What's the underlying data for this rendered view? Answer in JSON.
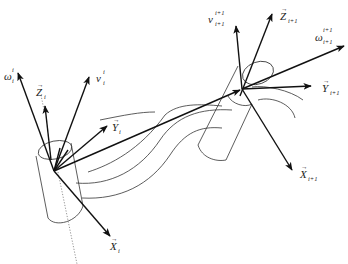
{
  "figure": {
    "type": "kinematic frame diagram",
    "frames": [
      {
        "id": "i",
        "origin": [
          54,
          171
        ],
        "vectors": [
          {
            "name": "omega",
            "label": "ω",
            "sup": "i",
            "sub": "i",
            "tip": [
              18,
              73
            ],
            "label_pos": [
              4,
              72
            ]
          },
          {
            "name": "z-axis",
            "label": "Z",
            "sub": "i",
            "vector_arrow": true,
            "tip": [
              45,
              106
            ],
            "label_pos": [
              36,
              86
            ]
          },
          {
            "name": "v",
            "label": "v",
            "sup": "i",
            "sub": "i",
            "tip": [
              89,
              77
            ],
            "label_pos": [
              95,
              74
            ]
          },
          {
            "name": "y-axis",
            "label": "Y",
            "sub": "i",
            "vector_arrow": true,
            "tip": [
              107,
              126
            ],
            "label_pos": [
              112,
              130
            ]
          },
          {
            "name": "x-axis",
            "label": "X",
            "sub": "i",
            "vector_arrow": true,
            "tip": [
              110,
              236
            ],
            "label_pos": [
              110,
              250
            ]
          }
        ]
      },
      {
        "id": "i+1",
        "origin": [
          242,
          89
        ],
        "vectors": [
          {
            "name": "v",
            "label": "v",
            "sup": "i+1",
            "sub": "i+1",
            "tip": [
              236,
              26
            ],
            "label_pos": [
              210,
              18
            ]
          },
          {
            "name": "z-axis",
            "label": "Z",
            "sub": "i+1",
            "vector_arrow": true,
            "tip": [
              272,
              14
            ],
            "label_pos": [
              280,
              18
            ]
          },
          {
            "name": "omega",
            "label": "ω",
            "sup": "i+1",
            "sub": "i+1",
            "tip": [
              344,
              46
            ],
            "label_pos": [
              310,
              34
            ]
          },
          {
            "name": "y-axis",
            "label": "Y",
            "sub": "i+1",
            "vector_arrow": true,
            "tip": [
              311,
              86
            ],
            "label_pos": [
              322,
              88
            ]
          },
          {
            "name": "x-axis",
            "label": "X",
            "sub": "i+1",
            "vector_arrow": true,
            "tip": [
              292,
              170
            ],
            "label_pos": [
              300,
              178
            ]
          }
        ]
      }
    ],
    "connecting_vector": {
      "from": [
        54,
        171
      ],
      "to": [
        242,
        89
      ]
    }
  },
  "labels": {
    "omega_i": {
      "base": "ω",
      "sup": "i",
      "sub": "i"
    },
    "z_i": {
      "base": "Z",
      "sub": "i"
    },
    "v_i": {
      "base": "v",
      "sup": "i",
      "sub": "i"
    },
    "y_i": {
      "base": "Y",
      "sub": "i"
    },
    "x_i": {
      "base": "X",
      "sub": "i"
    },
    "v_i1": {
      "base": "v",
      "sup": "i+1",
      "sub": "i+1"
    },
    "z_i1": {
      "base": "Z",
      "sub": "i+1"
    },
    "omega_i1": {
      "base": "ω",
      "sup": "i+1",
      "sub": "i+1"
    },
    "y_i1": {
      "base": "Y",
      "sub": "i+1"
    },
    "x_i1": {
      "base": "X",
      "sub": "i+1"
    },
    "vec_arrow": "→"
  }
}
